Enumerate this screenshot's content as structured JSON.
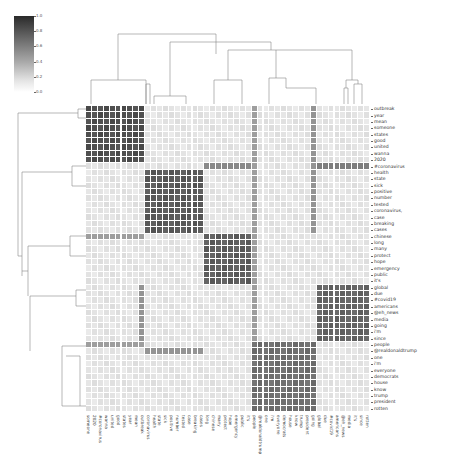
{
  "chart_data": {
    "type": "heatmap",
    "subtype": "clustermap",
    "title": "",
    "xlabel": "",
    "ylabel": "",
    "colorbar": {
      "min": 0.0,
      "max": 1.0,
      "ticks": [
        "1.0",
        "0.8",
        "0.6",
        "0.4",
        "0.2",
        "0.0"
      ],
      "cmap": "Greys"
    },
    "row_labels": [
      "outbreak",
      "year",
      "mean",
      "someone",
      "states",
      "good",
      "united",
      "wanna",
      "2020",
      "#coronavirus",
      "health",
      "state",
      "sick",
      "positive",
      "number",
      "tested",
      "coronavirus,",
      "case",
      "breaking",
      "cases",
      "chinese",
      "long",
      "many",
      "protect",
      "hope",
      "emergency",
      "public",
      "it's",
      "global",
      "due",
      "#covid19",
      "americans",
      "@eh_news",
      "media",
      "going",
      "i'm",
      "since",
      "people",
      "@realdonaldtrump",
      "one",
      "i'm",
      "everyone",
      "democrats",
      "house",
      "know",
      "trump",
      "president",
      "rotten"
    ],
    "col_labels": [
      "someone",
      "2020",
      "#coronavirus",
      "wanna",
      "united",
      "good",
      "states",
      "year",
      "mean",
      "outbreak",
      "coronavirus",
      "health",
      "state",
      "sick",
      "positive",
      "number",
      "tested",
      "case",
      "breaking",
      "cases",
      "long",
      "chinese",
      "many",
      "protect",
      "hope",
      "emergency",
      "public",
      "it's",
      "people",
      "@realdonaldtrump",
      "one",
      "i'm",
      "everyone",
      "democrats",
      "house",
      "know",
      "trump",
      "president",
      "going",
      "global",
      "due",
      "#covid19",
      "americans",
      "@eh_news",
      "media",
      "it's",
      "since",
      "rotten"
    ],
    "blocks": [
      {
        "name": "cluster-1",
        "rows": [
          0,
          8
        ],
        "cols": [
          0,
          9
        ],
        "value": 0.85
      },
      {
        "name": "cluster-2",
        "rows": [
          10,
          19
        ],
        "cols": [
          10,
          19
        ],
        "value": 0.8
      },
      {
        "name": "cluster-3",
        "rows": [
          20,
          27
        ],
        "cols": [
          20,
          27
        ],
        "value": 0.78
      },
      {
        "name": "cluster-4",
        "rows": [
          28,
          36
        ],
        "cols": [
          39,
          47
        ],
        "value": 0.75
      },
      {
        "name": "cluster-5",
        "rows": [
          37,
          47
        ],
        "cols": [
          28,
          38
        ],
        "value": 0.7
      }
    ],
    "highlight_lines": [
      {
        "row": 9,
        "cols": [
          20,
          27
        ],
        "value": 0.55
      },
      {
        "row": 9,
        "cols": [
          39,
          47
        ],
        "value": 0.6
      },
      {
        "row": 20,
        "cols": [
          0,
          9
        ],
        "value": 0.45
      },
      {
        "row": 37,
        "cols": [
          0,
          9
        ],
        "value": 0.45
      },
      {
        "row": 38,
        "cols": [
          10,
          19
        ],
        "value": 0.5
      },
      {
        "col": 9,
        "rows": [
          28,
          36
        ],
        "value": 0.5
      },
      {
        "col": 28,
        "rows": [
          0,
          36
        ],
        "value": 0.45
      },
      {
        "col": 38,
        "rows": [
          0,
          19
        ],
        "value": 0.5
      }
    ],
    "background_value": 0.1,
    "grid": true,
    "legend_position": "top-left"
  }
}
